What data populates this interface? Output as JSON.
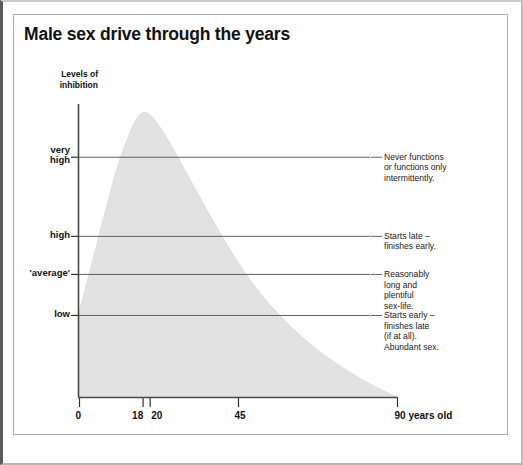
{
  "figure": {
    "title": "Male sex drive through the years",
    "y_axis_title_line1": "Levels of",
    "y_axis_title_line2": "inhibition",
    "x_axis_unit_label": "90 years old"
  },
  "chart_data": {
    "type": "area",
    "title": "Male sex drive through the years",
    "xlabel": "",
    "ylabel": "Levels of inhibition",
    "xlim": [
      0,
      90
    ],
    "ylim": [
      0,
      5
    ],
    "grid": true,
    "legend_position": "none",
    "x_ticks": [
      {
        "value": 0,
        "label": "0"
      },
      {
        "value": 18,
        "label": "18"
      },
      {
        "value": 20,
        "label": "20"
      },
      {
        "value": 45,
        "label": "45"
      },
      {
        "value": 90,
        "label": "90 years old"
      }
    ],
    "y_ticks": [
      {
        "value": 4.1,
        "label": "very high",
        "label_line1": "very",
        "label_line2": "high"
      },
      {
        "value": 2.75,
        "label": "high",
        "label_line1": "high",
        "label_line2": ""
      },
      {
        "value": 2.1,
        "label": "'average'",
        "label_line1": "'average'",
        "label_line2": ""
      },
      {
        "value": 1.4,
        "label": "low",
        "label_line1": "low",
        "label_line2": ""
      }
    ],
    "series": [
      {
        "name": "Levels of inhibition",
        "fill_color": "#e2e2e2",
        "x": [
          0,
          2,
          5,
          8,
          11,
          14,
          16,
          18,
          20,
          23,
          27,
          32,
          38,
          45,
          52,
          60,
          68,
          76,
          83,
          90
        ],
        "values": [
          1.45,
          1.9,
          2.6,
          3.3,
          3.95,
          4.45,
          4.72,
          4.85,
          4.82,
          4.6,
          4.2,
          3.65,
          3.0,
          2.3,
          1.72,
          1.2,
          0.78,
          0.45,
          0.2,
          0.0
        ]
      }
    ],
    "annotations": [
      {
        "y_value": 4.1,
        "lines": [
          "Never functions",
          "or functions only",
          "intermittently."
        ]
      },
      {
        "y_value": 2.75,
        "lines": [
          "Starts late –",
          "finishes early."
        ]
      },
      {
        "y_value": 2.1,
        "lines": [
          "Reasonably",
          "long and",
          "plentiful",
          "sex-life."
        ]
      },
      {
        "y_value": 1.4,
        "lines": [
          "Starts early –",
          "finishes late",
          "(if at all).",
          "Abundant sex."
        ]
      }
    ]
  }
}
